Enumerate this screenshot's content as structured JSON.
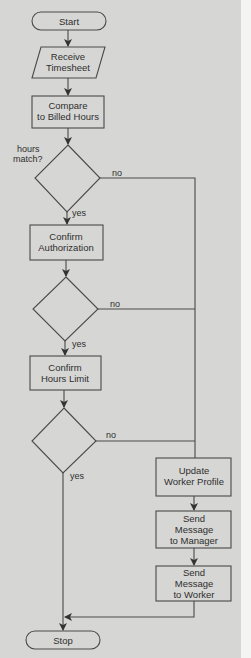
{
  "diagram": {
    "type": "flowchart",
    "colors": {
      "background": "#d6d6d4",
      "stroke": "#4a4a4a",
      "text": "#2e2e2e",
      "margin": "#f4f4f3"
    },
    "nodes": {
      "start": {
        "shape": "terminal",
        "label": "Start"
      },
      "receive": {
        "shape": "parallelogram",
        "lines": [
          "Receive",
          "Timesheet"
        ]
      },
      "compare": {
        "shape": "process",
        "lines": [
          "Compare",
          "to Billed Hours"
        ]
      },
      "decision1": {
        "shape": "decision",
        "lines": [
          "hours",
          "match?"
        ]
      },
      "confirm_auth": {
        "shape": "process",
        "lines": [
          "Confirm",
          "Authorization"
        ]
      },
      "decision2": {
        "shape": "decision",
        "lines": []
      },
      "confirm_limit": {
        "shape": "process",
        "lines": [
          "Confirm",
          "Hours Limit"
        ]
      },
      "decision3": {
        "shape": "decision",
        "lines": []
      },
      "update_profile": {
        "shape": "process",
        "lines": [
          "Update",
          "Worker Profile"
        ]
      },
      "msg_manager": {
        "shape": "process",
        "lines": [
          "Send",
          "Message",
          "to Manager"
        ]
      },
      "msg_worker": {
        "shape": "process",
        "lines": [
          "Send",
          "Message",
          "to Worker"
        ]
      },
      "stop": {
        "shape": "terminal",
        "label": "Stop"
      }
    },
    "edge_labels": {
      "d1_yes": "yes",
      "d1_no": "no",
      "d2_yes": "yes",
      "d2_no": "no",
      "d3_yes": "yes",
      "d3_no": "no"
    },
    "edges": [
      {
        "from": "start",
        "to": "receive"
      },
      {
        "from": "receive",
        "to": "compare"
      },
      {
        "from": "compare",
        "to": "decision1"
      },
      {
        "from": "decision1",
        "to": "confirm_auth",
        "label": "yes"
      },
      {
        "from": "decision1",
        "to": "update_profile",
        "label": "no"
      },
      {
        "from": "confirm_auth",
        "to": "decision2"
      },
      {
        "from": "decision2",
        "to": "confirm_limit",
        "label": "yes"
      },
      {
        "from": "decision2",
        "to": "update_profile",
        "label": "no"
      },
      {
        "from": "confirm_limit",
        "to": "decision3"
      },
      {
        "from": "decision3",
        "to": "stop",
        "label": "yes"
      },
      {
        "from": "decision3",
        "to": "update_profile",
        "label": "no"
      },
      {
        "from": "update_profile",
        "to": "msg_manager"
      },
      {
        "from": "msg_manager",
        "to": "msg_worker"
      },
      {
        "from": "msg_worker",
        "to": "stop"
      }
    ]
  }
}
